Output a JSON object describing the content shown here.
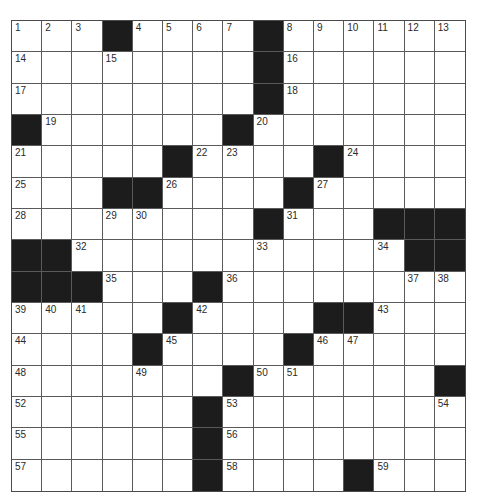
{
  "puzzle": {
    "rows": 15,
    "cols": 15,
    "colors": {
      "block": "#1c1c1c",
      "cell": "#ffffff",
      "line": "#5a5a5a",
      "number": "#2a2a2a"
    },
    "blocks": [
      [
        3,
        8
      ],
      [
        8
      ],
      [
        8
      ],
      [
        0,
        7
      ],
      [
        5,
        10
      ],
      [
        3,
        4,
        9
      ],
      [
        8,
        12,
        13,
        14
      ],
      [
        0,
        1,
        13,
        14
      ],
      [
        0,
        1,
        2,
        6
      ],
      [
        5,
        10,
        11
      ],
      [
        4,
        9
      ],
      [
        7,
        14
      ],
      [
        6
      ],
      [
        6
      ],
      [
        6,
        11
      ]
    ],
    "numbers": [
      {
        "r": 0,
        "c": 0,
        "n": "1"
      },
      {
        "r": 0,
        "c": 1,
        "n": "2"
      },
      {
        "r": 0,
        "c": 2,
        "n": "3"
      },
      {
        "r": 0,
        "c": 4,
        "n": "4"
      },
      {
        "r": 0,
        "c": 5,
        "n": "5"
      },
      {
        "r": 0,
        "c": 6,
        "n": "6"
      },
      {
        "r": 0,
        "c": 7,
        "n": "7"
      },
      {
        "r": 0,
        "c": 9,
        "n": "8"
      },
      {
        "r": 0,
        "c": 10,
        "n": "9"
      },
      {
        "r": 0,
        "c": 11,
        "n": "10"
      },
      {
        "r": 0,
        "c": 12,
        "n": "11"
      },
      {
        "r": 0,
        "c": 13,
        "n": "12"
      },
      {
        "r": 0,
        "c": 14,
        "n": "13"
      },
      {
        "r": 1,
        "c": 0,
        "n": "14"
      },
      {
        "r": 1,
        "c": 3,
        "n": "15"
      },
      {
        "r": 1,
        "c": 9,
        "n": "16"
      },
      {
        "r": 2,
        "c": 0,
        "n": "17"
      },
      {
        "r": 2,
        "c": 9,
        "n": "18"
      },
      {
        "r": 3,
        "c": 1,
        "n": "19"
      },
      {
        "r": 3,
        "c": 8,
        "n": "20"
      },
      {
        "r": 4,
        "c": 0,
        "n": "21"
      },
      {
        "r": 4,
        "c": 6,
        "n": "22"
      },
      {
        "r": 4,
        "c": 7,
        "n": "23"
      },
      {
        "r": 4,
        "c": 11,
        "n": "24"
      },
      {
        "r": 5,
        "c": 0,
        "n": "25"
      },
      {
        "r": 5,
        "c": 5,
        "n": "26"
      },
      {
        "r": 5,
        "c": 10,
        "n": "27"
      },
      {
        "r": 6,
        "c": 0,
        "n": "28"
      },
      {
        "r": 6,
        "c": 3,
        "n": "29"
      },
      {
        "r": 6,
        "c": 4,
        "n": "30"
      },
      {
        "r": 6,
        "c": 9,
        "n": "31"
      },
      {
        "r": 7,
        "c": 2,
        "n": "32"
      },
      {
        "r": 7,
        "c": 8,
        "n": "33"
      },
      {
        "r": 7,
        "c": 12,
        "n": "34"
      },
      {
        "r": 8,
        "c": 3,
        "n": "35"
      },
      {
        "r": 8,
        "c": 7,
        "n": "36"
      },
      {
        "r": 8,
        "c": 13,
        "n": "37"
      },
      {
        "r": 8,
        "c": 14,
        "n": "38"
      },
      {
        "r": 9,
        "c": 0,
        "n": "39"
      },
      {
        "r": 9,
        "c": 1,
        "n": "40"
      },
      {
        "r": 9,
        "c": 2,
        "n": "41"
      },
      {
        "r": 9,
        "c": 6,
        "n": "42"
      },
      {
        "r": 9,
        "c": 12,
        "n": "43"
      },
      {
        "r": 10,
        "c": 0,
        "n": "44"
      },
      {
        "r": 10,
        "c": 5,
        "n": "45"
      },
      {
        "r": 10,
        "c": 10,
        "n": "46"
      },
      {
        "r": 10,
        "c": 11,
        "n": "47"
      },
      {
        "r": 11,
        "c": 0,
        "n": "48"
      },
      {
        "r": 11,
        "c": 4,
        "n": "49"
      },
      {
        "r": 11,
        "c": 8,
        "n": "50"
      },
      {
        "r": 11,
        "c": 9,
        "n": "51"
      },
      {
        "r": 12,
        "c": 0,
        "n": "52"
      },
      {
        "r": 12,
        "c": 7,
        "n": "53"
      },
      {
        "r": 12,
        "c": 14,
        "n": "54"
      },
      {
        "r": 13,
        "c": 0,
        "n": "55"
      },
      {
        "r": 13,
        "c": 7,
        "n": "56"
      },
      {
        "r": 14,
        "c": 0,
        "n": "57"
      },
      {
        "r": 14,
        "c": 7,
        "n": "58"
      },
      {
        "r": 14,
        "c": 12,
        "n": "59"
      }
    ]
  }
}
